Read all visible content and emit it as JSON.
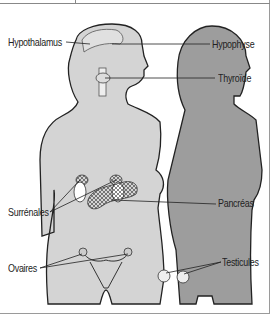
{
  "labels": {
    "hypothalamus": "Hypothalamus",
    "hypophyse": "Hypophyse",
    "thyroide": "Thyroïde",
    "pancreas": "Pancréas",
    "surrenales": "Surrénales",
    "ovaires": "Ovaires",
    "testicules": "Testicules"
  },
  "colors": {
    "female_body": "#d4d4d4",
    "male_body": "#9d9d9d",
    "outline": "#222222",
    "gland": "#e6e6e6"
  }
}
